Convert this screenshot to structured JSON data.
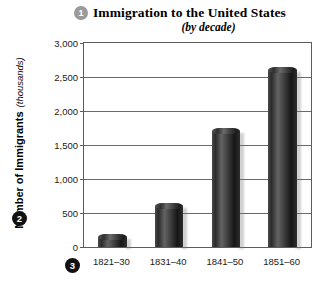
{
  "chart_data": {
    "type": "bar",
    "title": "Immigration to the United States",
    "subtitle": "(by decade)",
    "xlabel": "",
    "ylabel": "Number of Immigrants",
    "ylabel_units": "(thousands)",
    "categories": [
      "1821–30",
      "1831–40",
      "1841–50",
      "1851–60"
    ],
    "values": [
      150,
      600,
      1700,
      2600
    ],
    "ylim": [
      0,
      3000
    ],
    "yticks": [
      0,
      500,
      1000,
      1500,
      2000,
      2500,
      3000
    ],
    "ytick_labels": [
      "0",
      "500",
      "1,000",
      "1,500",
      "2,000",
      "2,500",
      "3,000"
    ],
    "grid": true,
    "legend": false,
    "bar_color": "#2e2e2e",
    "gridline_color": "#6a6a6a",
    "axis_color": "#5c5c5c",
    "background": "#ffffff"
  },
  "markers": {
    "one": "1",
    "two": "2",
    "three": "3"
  }
}
